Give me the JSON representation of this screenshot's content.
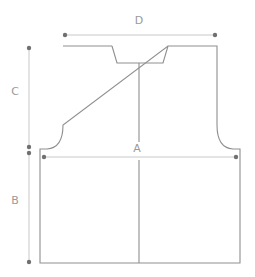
{
  "diagram": {
    "type": "garment-schematic",
    "colors": {
      "outline": "#8f8f8f",
      "dimension_line": "#c8c8c8",
      "dot": "#707070",
      "label": "#9a9a9a",
      "background": "#ffffff"
    },
    "measurements": {
      "A": {
        "label": "A",
        "meaning": "width across body"
      },
      "B": {
        "label": "B",
        "meaning": "length to underarm"
      },
      "C": {
        "label": "C",
        "meaning": "armhole depth"
      },
      "D": {
        "label": "D",
        "meaning": "shoulder width"
      }
    }
  }
}
